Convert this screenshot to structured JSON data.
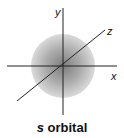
{
  "diagram": {
    "title": "s orbital",
    "caption_var": "s",
    "caption_rest": " orbital",
    "axes": [
      {
        "name": "x",
        "label": "x"
      },
      {
        "name": "y",
        "label": "y"
      },
      {
        "name": "z",
        "label": "z"
      }
    ],
    "shape": "sphere",
    "colors": {
      "sphere_light": "#d9d9d9",
      "sphere_dark": "#8a8a8a",
      "axis": "#222222"
    }
  }
}
